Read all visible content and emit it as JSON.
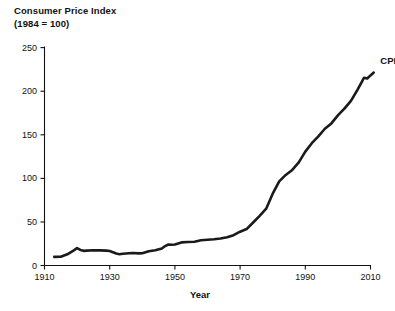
{
  "chart_data": {
    "type": "line",
    "title": "Consumer Price Index",
    "subtitle": "(1984 = 100)",
    "xlabel": "Year",
    "ylabel": "",
    "xlim": [
      1910,
      2013
    ],
    "ylim": [
      0,
      250
    ],
    "grid": false,
    "legend_position": "inline-end-of-line",
    "series": [
      {
        "name": "CPI",
        "color": "#1a1a1a",
        "x": [
          1913,
          1915,
          1917,
          1918,
          1919,
          1920,
          1921,
          1922,
          1923,
          1925,
          1927,
          1929,
          1930,
          1931,
          1932,
          1933,
          1934,
          1935,
          1937,
          1939,
          1940,
          1942,
          1944,
          1946,
          1947,
          1948,
          1949,
          1950,
          1952,
          1954,
          1956,
          1958,
          1960,
          1962,
          1964,
          1966,
          1968,
          1970,
          1972,
          1974,
          1976,
          1978,
          1980,
          1982,
          1984,
          1986,
          1988,
          1990,
          1992,
          1994,
          1996,
          1998,
          2000,
          2002,
          2004,
          2006,
          2008,
          2009,
          2010,
          2011
        ],
        "y": [
          9.9,
          10.1,
          12.8,
          15.1,
          17.3,
          20.0,
          17.9,
          16.8,
          17.1,
          17.5,
          17.4,
          17.1,
          16.7,
          15.2,
          13.7,
          13.0,
          13.4,
          13.7,
          14.4,
          13.9,
          14.0,
          16.3,
          17.6,
          19.5,
          22.3,
          24.1,
          23.8,
          24.1,
          26.5,
          26.9,
          27.2,
          28.9,
          29.6,
          30.2,
          31.0,
          32.4,
          34.8,
          38.8,
          41.8,
          49.3,
          56.9,
          65.2,
          82.4,
          96.5,
          103.9,
          109.6,
          118.3,
          130.7,
          140.3,
          148.2,
          156.9,
          163.0,
          172.2,
          179.9,
          188.9,
          201.6,
          215.3,
          214.5,
          218.1,
          221.3
        ]
      }
    ],
    "y_ticks": [
      0,
      50,
      100,
      150,
      200,
      250
    ],
    "x_ticks": [
      1910,
      1930,
      1950,
      1970,
      1990,
      2010
    ],
    "annotations": [
      {
        "text": "CPI",
        "x": 2013,
        "y": 235
      }
    ]
  },
  "colors": {
    "background": "#ffffff",
    "axis": "#111111",
    "line": "#1a1a1a",
    "text": "#111111"
  }
}
